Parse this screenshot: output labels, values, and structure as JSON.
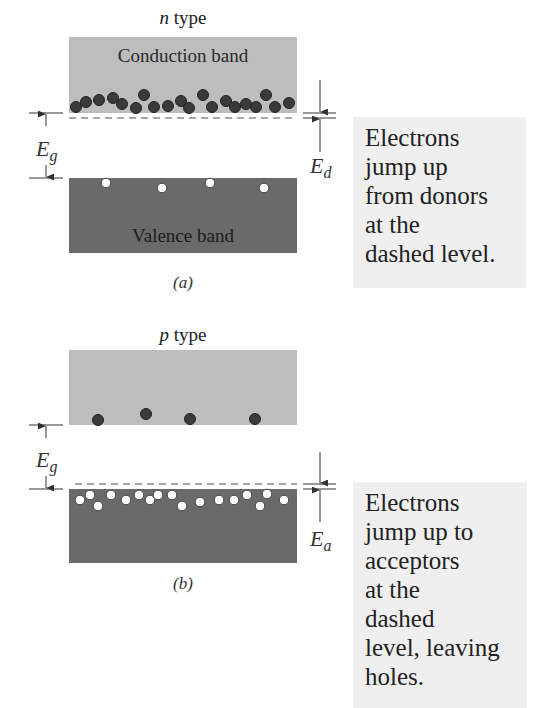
{
  "panel_a": {
    "title_italic": "n",
    "title_rest": " type",
    "conduction_label": "Conduction band",
    "valence_label": "Valence band",
    "gap_label_main": "E",
    "gap_label_sub": "g",
    "level_label_main": "E",
    "level_label_sub": "d",
    "sublabel": "(a)",
    "electrons_in_conduction": [
      [
        76,
        107
      ],
      [
        86,
        102
      ],
      [
        99,
        100
      ],
      [
        113,
        98
      ],
      [
        122,
        104
      ],
      [
        136,
        108
      ],
      [
        144,
        95
      ],
      [
        154,
        107
      ],
      [
        168,
        106
      ],
      [
        181,
        101
      ],
      [
        189,
        108
      ],
      [
        203,
        95
      ],
      [
        212,
        107
      ],
      [
        226,
        101
      ],
      [
        235,
        107
      ],
      [
        246,
        104
      ],
      [
        256,
        107
      ],
      [
        266,
        95
      ],
      [
        275,
        107
      ],
      [
        289,
        103
      ]
    ],
    "holes_in_valence": [
      [
        106,
        183
      ],
      [
        162,
        188
      ],
      [
        210,
        183
      ],
      [
        264,
        188
      ]
    ],
    "caption_lines": [
      "Electrons",
      "jump up",
      "from donors",
      "at the",
      "dashed level."
    ]
  },
  "panel_b": {
    "title_italic": "p",
    "title_rest": " type",
    "gap_label_main": "E",
    "gap_label_sub": "g",
    "level_label_main": "E",
    "level_label_sub": "a",
    "sublabel": "(b)",
    "electrons_in_conduction": [
      [
        98,
        420
      ],
      [
        146,
        414
      ],
      [
        190,
        419
      ],
      [
        255,
        419
      ]
    ],
    "holes_in_valence": [
      [
        80,
        500
      ],
      [
        90,
        495
      ],
      [
        98,
        506
      ],
      [
        111,
        495
      ],
      [
        126,
        500
      ],
      [
        139,
        495
      ],
      [
        150,
        500
      ],
      [
        158,
        495
      ],
      [
        172,
        495
      ],
      [
        182,
        506
      ],
      [
        200,
        502
      ],
      [
        219,
        500
      ],
      [
        234,
        500
      ],
      [
        247,
        495
      ],
      [
        260,
        506
      ],
      [
        267,
        494
      ],
      [
        284,
        500
      ]
    ],
    "caption_lines": [
      "Electrons",
      "jump up to",
      "acceptors",
      "at the",
      "dashed",
      "level, leaving",
      "holes."
    ]
  },
  "colors": {
    "conduction_band": "#bdbdbd",
    "valence_band": "#6a6a6a",
    "electron": "#3a3a3a",
    "hole_fill": "#ffffff",
    "caption_bg": "#efefef",
    "line": "#333333",
    "dashed": "#8a8a8a"
  }
}
